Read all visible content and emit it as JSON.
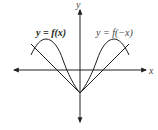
{
  "diagram": {
    "title": "",
    "axes": {
      "x_label": "x",
      "y_label": "y"
    },
    "curves": [
      {
        "name": "f",
        "label": "y = f(x)",
        "description": "curve peaking on left, passing through a point on negative y-axis"
      },
      {
        "name": "f-reflected",
        "label": "y = f(−x)",
        "description": "reflection of f across the y-axis"
      }
    ],
    "label_parts": {
      "f_left": "y = f(x)",
      "f_right": "y = f(−x)"
    },
    "colors": {
      "ink": "#231f20"
    }
  }
}
